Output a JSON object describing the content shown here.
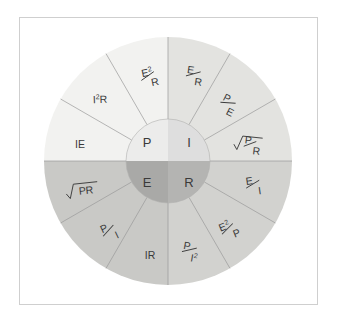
{
  "diagram": {
    "center_x": 168,
    "center_y": 161,
    "outer_radius": 124,
    "hub_radius": 42,
    "colors": {
      "background": "#ffffff",
      "frame_border": "#cfcfcf",
      "divider": "#9a9a9a",
      "text": "#3a3a3a",
      "ring_top_left": "#f2f2f0",
      "ring_top_right": "#e3e3e0",
      "ring_bottom_left": "#c9c9c6",
      "ring_bottom_right": "#d2d2cf",
      "hub_top_left": "#ececeb",
      "hub_top_right": "#dedede",
      "hub_bottom_left": "#a9a9a7",
      "hub_bottom_right": "#b4b4b2"
    }
  },
  "hub": {
    "quadrants": [
      {
        "key": "power",
        "label": "P",
        "position": "top-left"
      },
      {
        "key": "current",
        "label": "I",
        "position": "top-right"
      },
      {
        "key": "voltage",
        "label": "E",
        "position": "bottom-left"
      },
      {
        "key": "resistance",
        "label": "R",
        "position": "bottom-right"
      }
    ]
  },
  "ring": {
    "segments": [
      {
        "id": "seg-e2-over-r",
        "quadrant": "power",
        "type": "fraction",
        "numerator": "E",
        "numerator_sup": "2",
        "denominator": "R"
      },
      {
        "id": "seg-i2r",
        "quadrant": "power",
        "type": "plain",
        "text": "I",
        "sup": "2",
        "after": "R"
      },
      {
        "id": "seg-ie",
        "quadrant": "power",
        "type": "plain",
        "text": "IE"
      },
      {
        "id": "seg-e-over-r",
        "quadrant": "current",
        "type": "fraction",
        "numerator": "E",
        "denominator": "R"
      },
      {
        "id": "seg-p-over-e",
        "quadrant": "current",
        "type": "fraction",
        "numerator": "P",
        "denominator": "E"
      },
      {
        "id": "seg-sqrt-p-over-r",
        "quadrant": "current",
        "type": "sqrt-fraction",
        "numerator": "P",
        "denominator": "R"
      },
      {
        "id": "seg-sqrt-pr",
        "quadrant": "voltage",
        "type": "sqrt-plain",
        "text": "PR"
      },
      {
        "id": "seg-p-over-i",
        "quadrant": "voltage",
        "type": "fraction",
        "numerator": "P",
        "denominator": "I"
      },
      {
        "id": "seg-ir",
        "quadrant": "voltage",
        "type": "plain",
        "text": "IR"
      },
      {
        "id": "seg-p-over-i2",
        "quadrant": "resistance",
        "type": "fraction",
        "numerator": "P",
        "denominator": "I",
        "denominator_sup": "2"
      },
      {
        "id": "seg-e2-over-p",
        "quadrant": "resistance",
        "type": "fraction",
        "numerator": "E",
        "numerator_sup": "2",
        "denominator": "P"
      },
      {
        "id": "seg-e-over-i",
        "quadrant": "resistance",
        "type": "fraction",
        "numerator": "E",
        "denominator": "I"
      }
    ]
  }
}
